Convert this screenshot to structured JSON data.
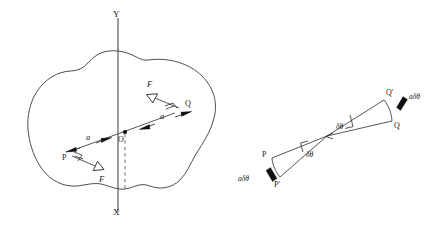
{
  "figure": {
    "title": "",
    "colors": {
      "ink": "#1a1a1a",
      "outline": "#3a3a3a",
      "axis": "#4a4a4a",
      "dashed": "#5a5a5a",
      "background": "#ffffff"
    },
    "left_panel": {
      "name": "rigid-body-couple-diagram",
      "axis_labels": {
        "y_top": "Y",
        "x_bottom": "X"
      },
      "points": {
        "origin": "O",
        "left_point": "P",
        "right_point": "Q"
      },
      "force_labels": {
        "upper": "F",
        "lower": "F"
      },
      "distance_labels": {
        "left": "a",
        "right": "a"
      }
    },
    "right_panel": {
      "name": "virtual-displacement-diagram",
      "points": {
        "p": "P",
        "p_prime": "P'",
        "q": "Q",
        "q_prime": "Q'"
      },
      "angle_labels": {
        "left": "δθ",
        "right": "δθ"
      },
      "displacement_labels": {
        "upper": "aδθ",
        "lower": "aδθ"
      }
    }
  }
}
